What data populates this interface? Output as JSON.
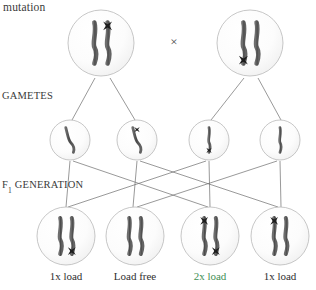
{
  "diagram": {
    "title_text": "mutation",
    "row_labels": {
      "mutation": "mutation",
      "gametes": "GAMETES",
      "f1_prefix": "F",
      "f1_subscript": "1",
      "f1_suffix": " GENERATION"
    },
    "cross_symbol": "×",
    "colors": {
      "chromosome": "#5a5a5a",
      "chromosome_dark": "#3d3d3d",
      "mutation_mark": "#1d1d1d",
      "cell_outline": "#b9b9b9",
      "cell_fill": "#fbfbfb",
      "line": "#6d6d6d",
      "text": "#2f2f2f",
      "highlight_text": "#3f8f55",
      "background": "#ffffff"
    },
    "parents": [
      {
        "id": "parent-left",
        "cx": 101,
        "cy": 43,
        "r": 33,
        "chromosomes": [
          {
            "side": "left",
            "mutations": []
          },
          {
            "side": "right",
            "mutations": [
              "top"
            ]
          }
        ]
      },
      {
        "id": "parent-right",
        "cx": 250,
        "cy": 43,
        "r": 33,
        "chromosomes": [
          {
            "side": "left",
            "mutations": [
              "bottom"
            ]
          },
          {
            "side": "right",
            "mutations": []
          }
        ]
      }
    ],
    "gametes": [
      {
        "id": "gamete-1",
        "cx": 70,
        "cy": 140,
        "r": 20,
        "mutations": [],
        "tilt": true
      },
      {
        "id": "gamete-2",
        "cx": 137,
        "cy": 140,
        "r": 20,
        "mutations": [
          "top"
        ],
        "tilt": true
      },
      {
        "id": "gamete-3",
        "cx": 209,
        "cy": 140,
        "r": 20,
        "mutations": [
          "bottom"
        ],
        "tilt": false
      },
      {
        "id": "gamete-4",
        "cx": 280,
        "cy": 140,
        "r": 20,
        "mutations": [],
        "tilt": false
      }
    ],
    "offspring": [
      {
        "id": "f1-1",
        "cx": 66,
        "cy": 236,
        "r": 29,
        "label": "1x load",
        "highlight": false,
        "chromosomes": [
          {
            "side": "left",
            "mutations": []
          },
          {
            "side": "right",
            "mutations": [
              "bottom"
            ]
          }
        ]
      },
      {
        "id": "f1-2",
        "cx": 135,
        "cy": 236,
        "r": 29,
        "label": "Load free",
        "highlight": false,
        "chromosomes": [
          {
            "side": "left",
            "mutations": []
          },
          {
            "side": "right",
            "mutations": []
          }
        ]
      },
      {
        "id": "f1-3",
        "cx": 210,
        "cy": 236,
        "r": 29,
        "label": "2x load",
        "highlight": true,
        "chromosomes": [
          {
            "side": "left",
            "mutations": [
              "top"
            ]
          },
          {
            "side": "right",
            "mutations": [
              "bottom"
            ]
          }
        ]
      },
      {
        "id": "f1-4",
        "cx": 280,
        "cy": 236,
        "r": 29,
        "label": "1x load",
        "highlight": false,
        "chromosomes": [
          {
            "side": "left",
            "mutations": [
              "top"
            ]
          },
          {
            "side": "right",
            "mutations": []
          }
        ]
      }
    ],
    "meiosis_lines": [
      {
        "from": "parent-left",
        "x1": 95,
        "y1": 78,
        "x2": 72,
        "y2": 120
      },
      {
        "from": "parent-left",
        "x1": 110,
        "y1": 78,
        "x2": 135,
        "y2": 120
      },
      {
        "from": "parent-right",
        "x1": 244,
        "y1": 78,
        "x2": 211,
        "y2": 120
      },
      {
        "from": "parent-right",
        "x1": 258,
        "y1": 78,
        "x2": 281,
        "y2": 120
      }
    ],
    "fertilization_lines": [
      {
        "from": "gamete-1",
        "to": "f1-1",
        "x1": 70,
        "y1": 161,
        "x2": 66,
        "y2": 207
      },
      {
        "from": "gamete-1",
        "to": "f1-3",
        "x1": 73,
        "y1": 161,
        "x2": 208,
        "y2": 207
      },
      {
        "from": "gamete-2",
        "to": "f1-2",
        "x1": 137,
        "y1": 161,
        "x2": 133,
        "y2": 207
      },
      {
        "from": "gamete-2",
        "to": "f1-4",
        "x1": 140,
        "y1": 161,
        "x2": 278,
        "y2": 207
      },
      {
        "from": "gamete-3",
        "to": "f1-1",
        "x1": 206,
        "y1": 161,
        "x2": 68,
        "y2": 207
      },
      {
        "from": "gamete-3",
        "to": "f1-3",
        "x1": 209,
        "y1": 161,
        "x2": 210,
        "y2": 207
      },
      {
        "from": "gamete-4",
        "to": "f1-2",
        "x1": 277,
        "y1": 161,
        "x2": 137,
        "y2": 207
      },
      {
        "from": "gamete-4",
        "to": "f1-4",
        "x1": 280,
        "y1": 161,
        "x2": 281,
        "y2": 207
      }
    ],
    "cross": {
      "x": 174,
      "y": 42
    }
  }
}
